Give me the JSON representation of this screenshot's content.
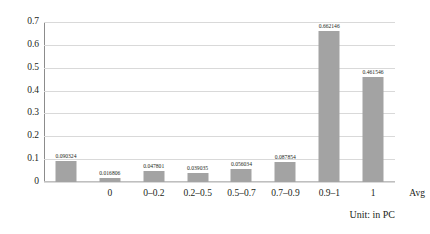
{
  "chart_data": {
    "type": "bar",
    "title": "",
    "subtitle": "",
    "xlabel": "",
    "ylabel": "",
    "categories": [
      "0",
      "0–0.2",
      "0.2–0.5",
      "0.5–0.7",
      "0.7–0.9",
      "0.9–1",
      "1",
      "Avg"
    ],
    "values": [
      0.090324,
      0.016806,
      0.047801,
      0.039035,
      0.056034,
      0.087854,
      0.662146,
      0.461546
    ],
    "value_labels": [
      "0.090324",
      "0.016806",
      "0.047801",
      "0.039035",
      "0.056034",
      "0.087854",
      "0.662146",
      "0.461546"
    ],
    "ylim": [
      0,
      0.7
    ],
    "yticks": [
      0,
      0.1,
      0.2,
      0.3,
      0.4,
      0.5,
      0.6,
      0.7
    ],
    "ytick_labels": [
      "0",
      "0.1",
      "0.2",
      "0.3",
      "0.4",
      "0.5",
      "0.6",
      "0.7"
    ],
    "grid": true,
    "grid_axis": "y",
    "legend": false,
    "legend_position": "none",
    "series": [
      {
        "name": "",
        "values": [
          0.090324,
          0.016806,
          0.047801,
          0.039035,
          0.056034,
          0.087854,
          0.662146,
          0.461546
        ]
      }
    ]
  },
  "annotations": {
    "unit_caption": "Unit: in PC"
  },
  "colors": {
    "bar_fill": "#a3a3a3",
    "gridline": "#d9d9d9",
    "axis": "#8c8c8c",
    "text": "#231f20",
    "background": "#ffffff"
  }
}
